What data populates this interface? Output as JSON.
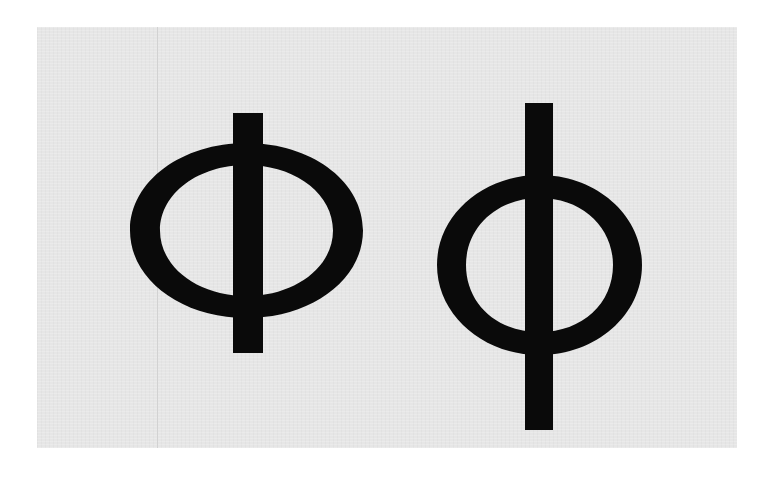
{
  "figure": {
    "background_color": "#e6e6e6",
    "glyph_color": "#0a0a0a",
    "glyphs": [
      {
        "char": "Φ",
        "name": "uppercase-phi",
        "label": "Greek capital letter Phi"
      },
      {
        "char": "φ",
        "name": "lowercase-phi",
        "label": "Greek small letter phi"
      }
    ]
  }
}
